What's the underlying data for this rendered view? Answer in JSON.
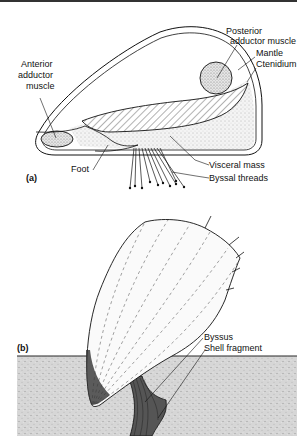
{
  "figure": {
    "panel_a": {
      "tag": "(a)",
      "labels": {
        "posterior_adductor_1": "Posterior",
        "posterior_adductor_2": "adductor muscle",
        "mantle": "Mantle",
        "ctenidium": "Ctenidium",
        "anterior_adductor_1": "Anterior",
        "anterior_adductor_2": "adductor",
        "anterior_adductor_3": "muscle",
        "foot": "Foot",
        "visceral_mass": "Visceral mass",
        "byssal_threads": "Byssal threads"
      }
    },
    "panel_b": {
      "tag": "(b)",
      "labels": {
        "byssus": "Byssus",
        "shell_fragment": "Shell fragment"
      }
    },
    "colors": {
      "ink": "#111111",
      "stipple_fill": "#e4e4e4",
      "sediment": "#d2d2d2",
      "background": "#ffffff"
    }
  }
}
